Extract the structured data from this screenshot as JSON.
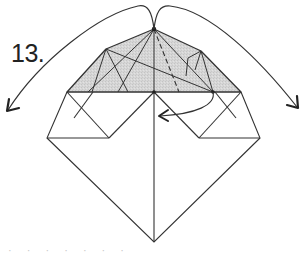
{
  "diagram": {
    "step_number": "13.",
    "caption_fragment": "· · ·   · · ·   ·",
    "colors": {
      "line": "#333333",
      "shade": "#d4d4d4",
      "background": "#ffffff",
      "label": "#222222"
    },
    "elements": {
      "shaded_region": "top flap (grey, folded layer)",
      "arrows": [
        {
          "name": "left-fold-arrow",
          "direction": "down-left",
          "from": "apex",
          "meaning": "fold left corner over"
        },
        {
          "name": "right-fold-arrow",
          "direction": "down-right",
          "from": "apex",
          "meaning": "fold right corner over"
        },
        {
          "name": "tuck-arrow",
          "direction": "left",
          "from": "right base vertex",
          "meaning": "tuck/swing to center"
        }
      ],
      "line_styles": [
        "solid crease",
        "dashed valley fold"
      ]
    }
  }
}
